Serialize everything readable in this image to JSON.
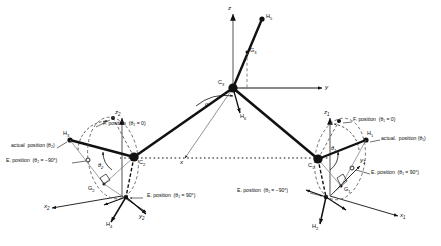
{
  "figure": {
    "kind": "kinematic-skeleton-diagram",
    "header_strip": "redacted page header text",
    "ink_color": "#111111",
    "accent_gray": "#8a8a8a"
  },
  "joints": [
    {
      "id": "C3",
      "label": "C",
      "sub": "3"
    },
    {
      "id": "C2",
      "label": "C",
      "sub": "2"
    },
    {
      "id": "C1",
      "label": "C",
      "sub": "1"
    }
  ],
  "link_points": [
    {
      "id": "H5",
      "label": "H",
      "sub": "5"
    },
    {
      "id": "H6",
      "label": "H",
      "sub": "6"
    },
    {
      "id": "H3",
      "label": "H",
      "sub": "3"
    },
    {
      "id": "H4",
      "label": "H",
      "sub": "4"
    },
    {
      "id": "H1",
      "label": "H",
      "sub": "1"
    },
    {
      "id": "H2",
      "label": "H",
      "sub": "2"
    }
  ],
  "centroids": [
    {
      "id": "G3",
      "label": "G",
      "sub": "3"
    },
    {
      "id": "G2",
      "label": "G",
      "sub": "2"
    },
    {
      "id": "G1",
      "label": "G",
      "sub": "1"
    }
  ],
  "axes": [
    {
      "id": "z",
      "label": "z",
      "sub": ""
    },
    {
      "id": "y",
      "label": "y",
      "sub": ""
    },
    {
      "id": "x",
      "label": "x",
      "sub": ""
    },
    {
      "id": "z2",
      "label": "z",
      "sub": "2"
    },
    {
      "id": "y2",
      "label": "y",
      "sub": "2"
    },
    {
      "id": "x2",
      "label": "x",
      "sub": "2"
    },
    {
      "id": "z1",
      "label": "z",
      "sub": "1"
    },
    {
      "id": "y1",
      "label": "y",
      "sub": "1"
    },
    {
      "id": "x1",
      "label": "x",
      "sub": "1"
    }
  ],
  "angles": [
    {
      "id": "alpha",
      "label": "α"
    },
    {
      "id": "theta2",
      "label": "θ",
      "sub": "2"
    },
    {
      "id": "theta1",
      "label": "θ",
      "sub": "1"
    }
  ],
  "annotations": {
    "left": {
      "actual": "actual  position (θ₂)",
      "folded": "F. position  (θ₂ = 0)",
      "extended_neg": "E. position  (θ₂ = −90°)",
      "extended_pos": "E. position  (θ₂ = 90°)"
    },
    "right": {
      "actual": "actual.  position (θ₁)",
      "folded": "F. position  (θ₁ = 0)",
      "extended_neg": "E. position  (θ₁ = −90°)",
      "extended_pos": "E. position  (θ₁ = 90°)"
    }
  }
}
